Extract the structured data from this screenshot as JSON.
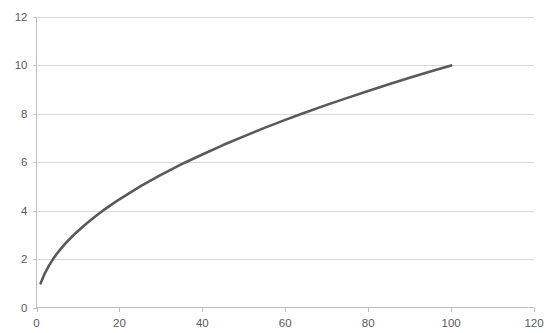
{
  "chart_data": {
    "type": "line",
    "title": "",
    "subtitle": "",
    "xlabel": "",
    "ylabel": "",
    "xlim": [
      0,
      120
    ],
    "ylim": [
      0,
      12
    ],
    "grid": "horizontal",
    "legend": "none",
    "function": "y = sqrt(x)",
    "series": [
      {
        "name": "sqrt(x)",
        "color": "#595959",
        "line_width": 2.6,
        "x": [
          1,
          2,
          3,
          4,
          5,
          6,
          7,
          8,
          9,
          10,
          12,
          14,
          16,
          18,
          20,
          25,
          30,
          35,
          36,
          40,
          45,
          50,
          55,
          60,
          64,
          70,
          75,
          80,
          85,
          90,
          95,
          100
        ],
        "values": [
          1,
          1.41,
          1.73,
          2,
          2.24,
          2.45,
          2.65,
          2.83,
          3,
          3.16,
          3.46,
          3.74,
          4,
          4.24,
          4.47,
          5,
          5.48,
          5.92,
          6,
          6.32,
          6.71,
          7.07,
          7.42,
          7.75,
          8,
          8.37,
          8.66,
          8.94,
          9.22,
          9.49,
          9.75,
          10
        ]
      }
    ],
    "y_ticks": [
      0,
      2,
      4,
      6,
      8,
      10,
      12
    ],
    "y_tick_labels": [
      "0",
      "2",
      "4",
      "6",
      "8",
      "10",
      "12"
    ],
    "x_ticks": [
      0,
      20,
      40,
      60,
      80,
      100,
      120
    ],
    "x_tick_labels": [
      "0",
      "20",
      "40",
      "60",
      "80",
      "100",
      "120"
    ]
  },
  "style": {
    "background": "#ffffff",
    "gridline_color": "#d9d9d9",
    "axis_color": "#bfbfbf",
    "tick_label_color": "#595959",
    "series_color": "#595959"
  },
  "artifacts": {
    "top_clipped_text": "———"
  }
}
